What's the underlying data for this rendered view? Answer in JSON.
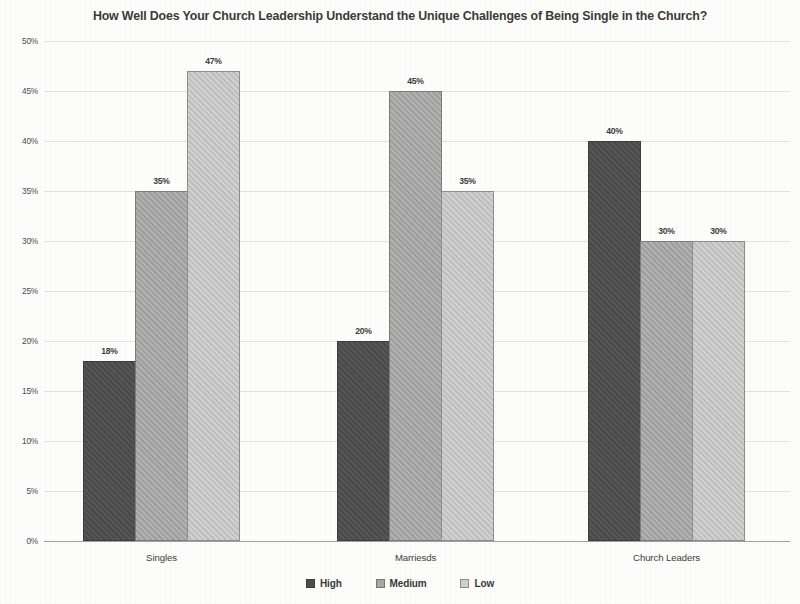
{
  "chart_data": {
    "type": "bar",
    "title": "How Well Does Your Church Leadership Understand the Unique Challenges of Being Single in the Church?",
    "xlabel": "",
    "ylabel": "",
    "categories": [
      "Singles",
      "Marriesds",
      "Church Leaders"
    ],
    "series": [
      {
        "name": "High",
        "color": "#4d4d4d",
        "values": [
          18,
          20,
          40
        ],
        "labels": [
          "18%",
          "20%",
          "40%"
        ]
      },
      {
        "name": "Medium",
        "color": "#a6a6a6",
        "values": [
          35,
          45,
          30
        ],
        "labels": [
          "35%",
          "45%",
          "30%"
        ]
      },
      {
        "name": "Low",
        "color": "#c6c6c6",
        "values": [
          47,
          35,
          30
        ],
        "labels": [
          "47%",
          "35%",
          "30%"
        ]
      }
    ],
    "ylim": [
      0,
      50
    ],
    "ytick_step": 5,
    "ytick_labels": [
      "50%",
      "45%",
      "40%",
      "35%",
      "30%",
      "25%",
      "20%",
      "15%",
      "10%",
      "5%",
      "0%"
    ],
    "ytick_values": [
      50,
      45,
      40,
      35,
      30,
      25,
      20,
      15,
      10,
      5,
      0
    ],
    "grid": true,
    "legend_position": "bottom",
    "value_labels_shown": true
  }
}
